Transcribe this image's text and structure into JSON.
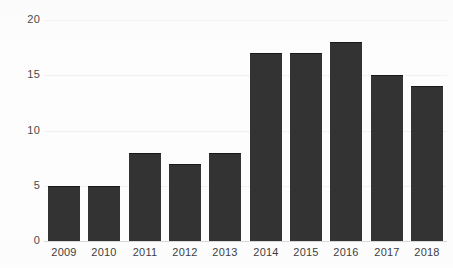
{
  "chart_data": {
    "type": "bar",
    "title": "",
    "subtitle": "",
    "xlabel": "",
    "ylabel": "",
    "categories": [
      "2009",
      "2010",
      "2011",
      "2012",
      "2013",
      "2014",
      "2015",
      "2016",
      "2017",
      "2018"
    ],
    "values": [
      5,
      5,
      8,
      7,
      8,
      17,
      17,
      18,
      15,
      14
    ],
    "ylim": [
      0,
      20
    ],
    "yticks": [
      0,
      5,
      10,
      15,
      20
    ],
    "ytick_labels": [
      "0",
      "5",
      "10",
      "15",
      "20"
    ],
    "grid": "horizontal",
    "legend": "none",
    "bar_color": "#333333",
    "gridline_color": "#f1f1f1",
    "axis_color": "#d8d8d8",
    "background_color": "#fdfdfd",
    "annotations": []
  }
}
